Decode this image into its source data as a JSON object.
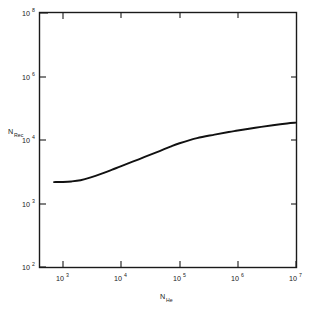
{
  "chart_data": {
    "type": "line",
    "title": "",
    "subtitle": "",
    "xlabel": "N_He",
    "ylabel": "N_Rec",
    "xlabel_base": "N",
    "xlabel_sub": "He",
    "ylabel_base": "N",
    "ylabel_sub": "Rec",
    "xscale": "log",
    "yscale": "log",
    "grid": false,
    "legend": null,
    "legend_position": "none",
    "xlim": [
      700,
      10000000
    ],
    "ylim": [
      100,
      100000000
    ],
    "xticks": [
      {
        "value": 1000,
        "base": "10",
        "exp": "3"
      },
      {
        "value": 10000,
        "base": "10",
        "exp": "4"
      },
      {
        "value": 100000,
        "base": "10",
        "exp": "5"
      },
      {
        "value": 1000000,
        "base": "10",
        "exp": "6"
      },
      {
        "value": 10000000,
        "base": "10",
        "exp": "7"
      }
    ],
    "yticks": [
      {
        "value": 100,
        "base": "10",
        "exp": "2"
      },
      {
        "value": 1000,
        "base": "10",
        "exp": "3"
      },
      {
        "value": 10000,
        "base": "10",
        "exp": "4"
      },
      {
        "value": 1000000,
        "base": "10",
        "exp": "6"
      },
      {
        "value": 100000000,
        "base": "10",
        "exp": "8"
      }
    ],
    "series": [
      {
        "name": "N_Rec vs N_He",
        "color": "#111111",
        "x": [
          700,
          1000,
          1400,
          2000,
          3000,
          4500,
          7000,
          10000,
          20000,
          40000,
          70000,
          100000,
          200000,
          400000,
          700000,
          1000000,
          2000000,
          4000000,
          7000000,
          10000000
        ],
        "y": [
          2200,
          2210,
          2250,
          2350,
          2600,
          2950,
          3450,
          3900,
          5000,
          6400,
          7900,
          8900,
          11500,
          14800,
          18000,
          20000,
          24500,
          29500,
          33500,
          35500
        ]
      }
    ],
    "annotations": []
  },
  "figure": {
    "background_color": "#ffffff",
    "frame_color": "#1a1a1a",
    "text_color": "#1a1a1a"
  }
}
